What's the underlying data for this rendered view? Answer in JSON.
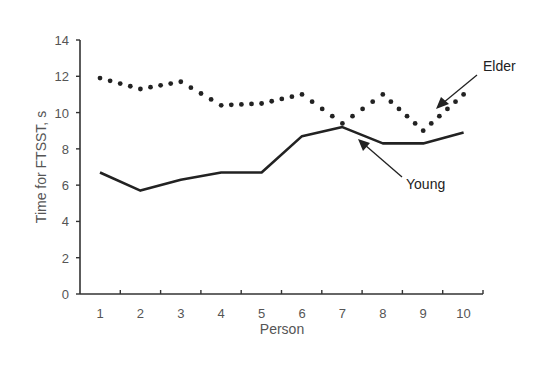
{
  "chart_data": {
    "type": "line",
    "title": "",
    "xlabel": "Person",
    "ylabel": "Time for FTSST, s",
    "x": [
      1,
      2,
      3,
      4,
      5,
      6,
      7,
      8,
      9,
      10
    ],
    "ylim": [
      0,
      14
    ],
    "yticks": [
      0,
      2,
      4,
      6,
      8,
      10,
      12,
      14
    ],
    "grid": false,
    "legend": "annotations",
    "series": [
      {
        "name": "Elder",
        "style": "dotted",
        "values": [
          11.9,
          11.3,
          11.7,
          10.4,
          10.5,
          11.0,
          9.4,
          11.0,
          9.0,
          11.0
        ]
      },
      {
        "name": "Young",
        "style": "solid",
        "values": [
          6.7,
          5.7,
          6.3,
          6.7,
          6.7,
          8.7,
          9.2,
          8.3,
          8.3,
          8.9
        ]
      }
    ],
    "annotations": [
      {
        "text": "Elder",
        "points_to_series": "Elder",
        "near_x": 9.4
      },
      {
        "text": "Young",
        "points_to_series": "Young",
        "near_x": 7.0
      }
    ]
  },
  "axes": {
    "x_title": "Person",
    "y_title": "Time for FTSST, s"
  },
  "labels": {
    "elder": "Elder",
    "young": "Young"
  }
}
